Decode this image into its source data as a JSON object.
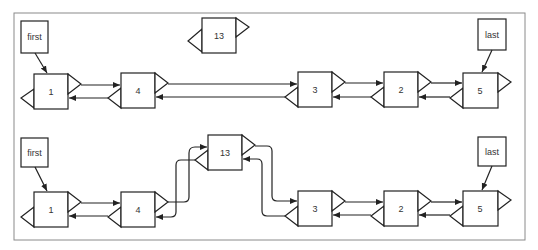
{
  "diagram": {
    "frame_color": "#8a8a8a",
    "stroke_color": "#222222",
    "new_node": {
      "label": "13"
    },
    "before": {
      "pointers": {
        "first": "first",
        "last": "last"
      },
      "nodes": [
        {
          "label": "1"
        },
        {
          "label": "4"
        },
        {
          "label": "3"
        },
        {
          "label": "2"
        },
        {
          "label": "5"
        }
      ]
    },
    "after": {
      "pointers": {
        "first": "first",
        "last": "last"
      },
      "nodes": [
        {
          "label": "1"
        },
        {
          "label": "4"
        },
        {
          "label": "13"
        },
        {
          "label": "3"
        },
        {
          "label": "2"
        },
        {
          "label": "5"
        }
      ]
    }
  }
}
